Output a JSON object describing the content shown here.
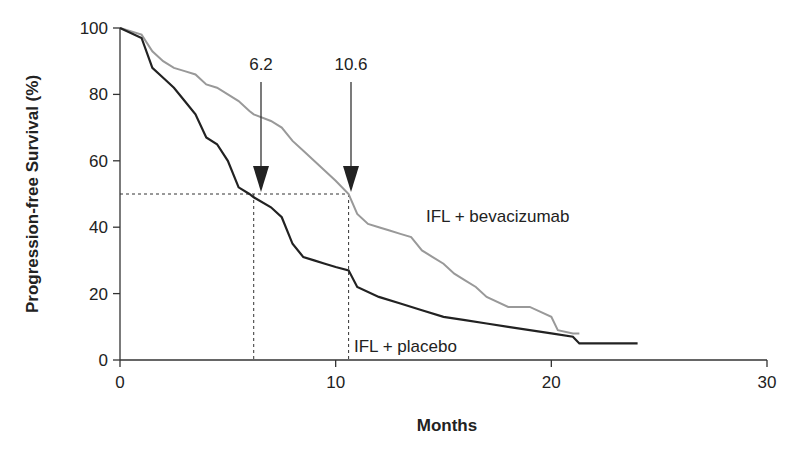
{
  "chart_data": {
    "type": "line",
    "title": "",
    "xlabel": "Months",
    "ylabel": "Progression-free Survival (%)",
    "xlim": [
      0,
      30
    ],
    "ylim": [
      0,
      100
    ],
    "x_ticks": [
      0,
      10,
      20,
      30
    ],
    "y_ticks": [
      0,
      20,
      40,
      60,
      80,
      100
    ],
    "grid": false,
    "legend": "inline labels",
    "series": [
      {
        "name": "IFL + bevacizumab",
        "color": "#999999",
        "x": [
          0,
          1.0,
          1.5,
          2.0,
          2.5,
          3.0,
          3.5,
          4.0,
          4.5,
          5.0,
          5.5,
          6.0,
          6.2,
          7.0,
          7.5,
          8.0,
          8.5,
          9.0,
          9.5,
          10.0,
          10.6,
          11.0,
          11.5,
          12.0,
          12.5,
          13.0,
          13.5,
          14.0,
          14.5,
          15.0,
          15.5,
          16.0,
          16.5,
          17.0,
          18.0,
          19.0,
          20.0,
          20.3,
          21.0,
          21.3
        ],
        "y": [
          100,
          98,
          93,
          90,
          88,
          87,
          86,
          83,
          82,
          80,
          78,
          75,
          74,
          72,
          70,
          66,
          63,
          60,
          57,
          54,
          50,
          44,
          41,
          40,
          39,
          38,
          37,
          33,
          31,
          29,
          26,
          24,
          22,
          19,
          16,
          16,
          13,
          9,
          8,
          8
        ]
      },
      {
        "name": "IFL + placebo",
        "color": "#222222",
        "x": [
          0,
          1.0,
          1.5,
          2.0,
          2.5,
          3.0,
          3.5,
          4.0,
          4.5,
          5.0,
          5.5,
          6.0,
          6.2,
          7.0,
          7.5,
          8.0,
          8.5,
          9.0,
          9.5,
          10.0,
          10.6,
          11.0,
          12.0,
          13.0,
          14.0,
          15.0,
          16.0,
          17.0,
          18.0,
          20.0,
          21.0,
          21.3,
          24.0
        ],
        "y": [
          100,
          97,
          88,
          85,
          82,
          78,
          74,
          67,
          65,
          60,
          52,
          50,
          49,
          46,
          43,
          35,
          31,
          30,
          29,
          28,
          27,
          22,
          19,
          17,
          15,
          13,
          12,
          11,
          10,
          8,
          7,
          5,
          5
        ]
      }
    ],
    "annotations": [
      {
        "text": "6.2",
        "x": 6.2,
        "type": "arrow",
        "target_y": 50
      },
      {
        "text": "10.6",
        "x": 10.6,
        "type": "arrow",
        "target_y": 50
      },
      {
        "text": "IFL + bevacizumab",
        "x": 15,
        "y": 42
      },
      {
        "text": "IFL + placebo",
        "x": 11,
        "y": 5
      }
    ],
    "median_line": {
      "y": 50,
      "x_values": [
        6.2,
        10.6
      ],
      "style": "dashed"
    }
  },
  "labels": {
    "xlabel": "Months",
    "ylabel": "Progression-free Survival (%)",
    "x_ticks": [
      "0",
      "10",
      "20",
      "30"
    ],
    "y_ticks": [
      "0",
      "20",
      "40",
      "60",
      "80",
      "100"
    ],
    "arrow_placebo": "6.2",
    "arrow_bev": "10.6",
    "series_bev": "IFL + bevacizumab",
    "series_placebo": "IFL + placebo"
  }
}
